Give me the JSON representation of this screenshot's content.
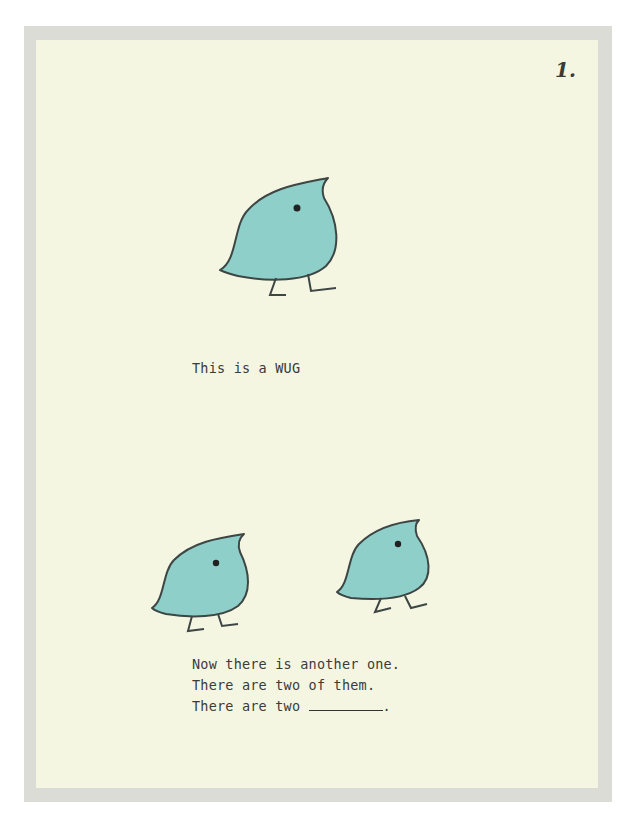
{
  "page": {
    "number": "1.",
    "background_color": "#f4f6e2",
    "border_color": "#dcdcd6"
  },
  "figures": [
    {
      "name": "wug-single",
      "description": "One blue bird-like creature (a WUG)",
      "fill_color": "#8ecfc9"
    },
    {
      "name": "wug-left",
      "description": "First of two WUGs",
      "fill_color": "#8ecfc9"
    },
    {
      "name": "wug-right",
      "description": "Second of two WUGs",
      "fill_color": "#8ecfc9"
    }
  ],
  "text": {
    "line1": "This is a WUG",
    "line2": "Now there is another one.",
    "line3": "There are two of them.",
    "line4_prefix": "There are two ",
    "line4_suffix": "."
  }
}
